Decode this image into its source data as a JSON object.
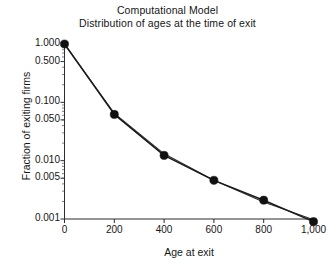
{
  "figure": {
    "title_lines": [
      "Computational Model",
      "Distribution of ages at the time of exit"
    ],
    "background_color": "#ffffff",
    "ink_color": "#1a1a1a"
  },
  "chart_data": {
    "type": "line",
    "title": "Computational Model\nDistribution of ages at the time of exit",
    "subtitle": "Distribution of ages at the time of exit",
    "xlabel": "Age at exit",
    "ylabel": "Fraction of exiting firms",
    "yscale": "log",
    "xlim": [
      0,
      1000
    ],
    "ylim": [
      0.001,
      1.0
    ],
    "grid": false,
    "legend": null,
    "x": [
      0,
      200,
      400,
      600,
      800,
      1000
    ],
    "series": [
      {
        "name": "model-distribution",
        "marker": "filled-circle",
        "values": [
          1.0,
          0.062,
          0.0123,
          0.0046,
          0.0021,
          0.0009
        ]
      },
      {
        "name": "fitted-exponential-line",
        "marker": "none",
        "values": [
          1.0,
          0.0646,
          0.0131,
          0.0046,
          0.00195,
          0.00097
        ]
      }
    ],
    "xticks": [
      0,
      200,
      400,
      600,
      800,
      1000
    ],
    "xtick_labels": [
      "0",
      "200",
      "400",
      "600",
      "800",
      "1,000"
    ],
    "yticks": [
      1.0,
      0.5,
      0.1,
      0.05,
      0.01,
      0.005,
      0.001
    ],
    "ytick_labels": [
      "1.000",
      "0.500",
      "0.100",
      "0.050",
      "0.010",
      "0.005",
      "0.001"
    ]
  }
}
